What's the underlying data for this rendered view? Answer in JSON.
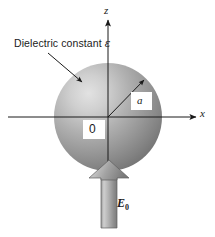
{
  "figure": {
    "caption_labels": {
      "dielectric_prefix": "Dielectric constant",
      "dielectric_symbol": "ε",
      "axis_z": "z",
      "axis_x": "x",
      "radius": "a",
      "origin": "0",
      "field_symbol": "E",
      "field_subscript": "0"
    },
    "colors": {
      "line": "#1a1a1a",
      "text": "#1a1a1a",
      "background": "#ffffff",
      "sphere_highlight": "#d8d8d8",
      "sphere_mid": "#a8a8a8",
      "sphere_dark": "#6e6e6e",
      "arrow_light": "#c9c9c9",
      "arrow_mid": "#9d9d9d",
      "arrow_dark": "#787878"
    },
    "geometry": {
      "origin_x": 108,
      "origin_y": 117,
      "sphere_radius": 54,
      "z_axis_top": 18,
      "z_axis_bottom": 196,
      "x_axis_left": 8,
      "x_axis_right": 198,
      "radius_arrow_angle_deg": 45
    }
  }
}
